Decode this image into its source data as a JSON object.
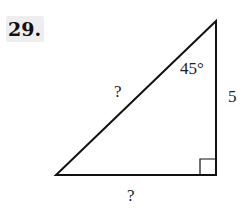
{
  "problem": {
    "number": "29.",
    "header_cutoff_text": "",
    "figure": {
      "type": "right-triangle",
      "angle_label": "45°",
      "vertical_leg_label": "5",
      "hypotenuse_label": "?",
      "base_label": "?",
      "right_angle_marker": true,
      "vertices": {
        "top": [
          216,
          21
        ],
        "bottom_left": [
          56,
          175
        ],
        "bottom_right": [
          216,
          175
        ]
      },
      "stroke_color": "#111111",
      "label_bg_color": "#eeeeee"
    }
  }
}
